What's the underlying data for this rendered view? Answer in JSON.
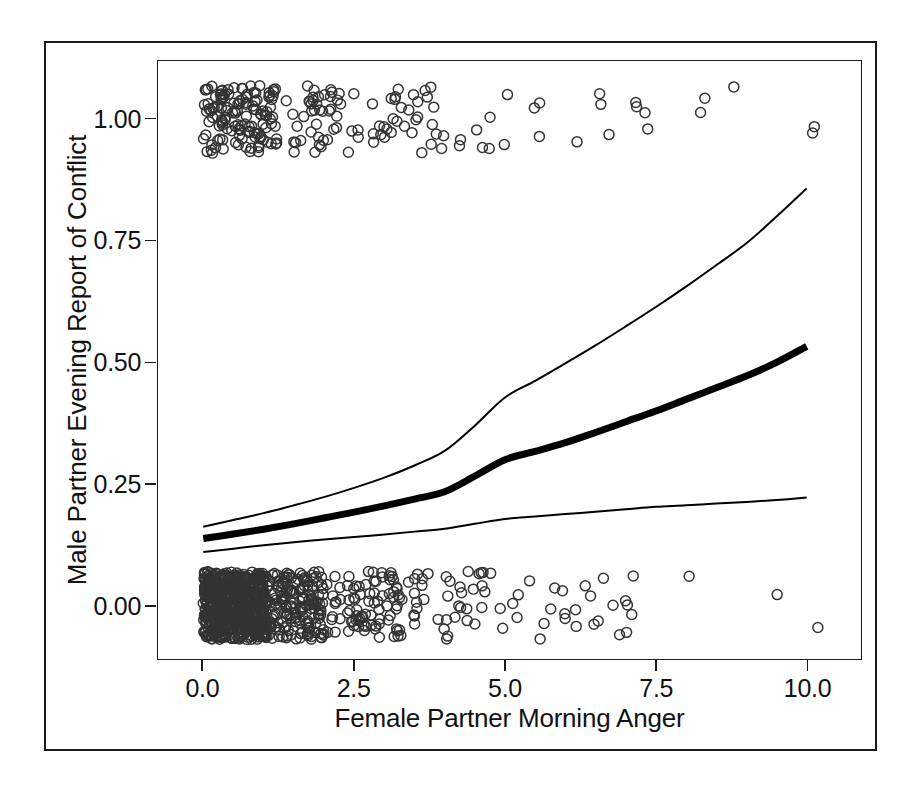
{
  "figure": {
    "background": "#ffffff",
    "frame_color": "#1a1a1a",
    "point_color": "#333333",
    "line_color": "#000000"
  },
  "chart_data": {
    "type": "scatter",
    "title": "",
    "xlabel": "Female Partner Morning Anger",
    "ylabel": "Male Partner Evening Report of Conflict",
    "xlim": [
      -0.75,
      10.9
    ],
    "ylim": [
      -0.11,
      1.12
    ],
    "xticks": [
      0.0,
      2.5,
      5.0,
      7.5,
      10.0
    ],
    "xtick_labels": [
      "0.0",
      "2.5",
      "5.0",
      "7.5",
      "10.0"
    ],
    "yticks": [
      0.0,
      0.25,
      0.5,
      0.75,
      1.0
    ],
    "ytick_labels": [
      "0.00",
      "0.25",
      "0.50",
      "0.75",
      "1.00"
    ],
    "grid": false,
    "legend": "none",
    "marker": "open-circle",
    "marker_size_px": 10,
    "series": [
      {
        "name": "fitted-probability",
        "type": "line",
        "style": "thick",
        "width_px": 7,
        "x": [
          0.0,
          0.5,
          1.0,
          1.5,
          2.0,
          2.5,
          3.0,
          3.5,
          4.0,
          4.5,
          5.0,
          5.5,
          6.0,
          6.5,
          7.0,
          7.5,
          8.0,
          8.5,
          9.0,
          9.5,
          10.0
        ],
        "values": [
          0.138,
          0.147,
          0.157,
          0.168,
          0.18,
          0.192,
          0.205,
          0.219,
          0.234,
          0.266,
          0.3,
          0.317,
          0.335,
          0.356,
          0.378,
          0.4,
          0.424,
          0.448,
          0.472,
          0.5,
          0.533
        ]
      },
      {
        "name": "confidence-upper",
        "type": "line",
        "style": "thin",
        "width_px": 2,
        "x": [
          0.0,
          0.5,
          1.0,
          1.5,
          2.0,
          2.5,
          3.0,
          3.5,
          4.0,
          4.5,
          5.0,
          5.5,
          6.0,
          6.5,
          7.0,
          7.5,
          8.0,
          8.5,
          9.0,
          9.5,
          10.0
        ],
        "values": [
          0.162,
          0.176,
          0.19,
          0.206,
          0.223,
          0.242,
          0.263,
          0.288,
          0.318,
          0.37,
          0.428,
          0.462,
          0.498,
          0.535,
          0.574,
          0.614,
          0.656,
          0.7,
          0.745,
          0.8,
          0.858
        ]
      },
      {
        "name": "confidence-lower",
        "type": "line",
        "style": "thin",
        "width_px": 2,
        "x": [
          0.0,
          0.5,
          1.0,
          1.5,
          2.0,
          2.5,
          3.0,
          3.5,
          4.0,
          4.5,
          5.0,
          5.5,
          6.0,
          6.5,
          7.0,
          7.5,
          8.0,
          8.5,
          9.0,
          9.5,
          10.0
        ],
        "values": [
          0.11,
          0.117,
          0.124,
          0.13,
          0.136,
          0.141,
          0.146,
          0.152,
          0.158,
          0.168,
          0.178,
          0.183,
          0.188,
          0.193,
          0.198,
          0.203,
          0.206,
          0.21,
          0.213,
          0.217,
          0.222
        ]
      }
    ],
    "scatter_bands": [
      {
        "name": "outcome-one-band",
        "y_center": 1.0,
        "y_jitter": 0.07,
        "n_points": 232,
        "x_distribution": "right-skewed, dense 0-1.5, sparse beyond 3"
      },
      {
        "name": "outcome-zero-band",
        "y_center": 0.0,
        "y_jitter": 0.07,
        "n_points": 900,
        "x_distribution": "right-skewed, saturated 0-1, thinning beyond 3"
      }
    ]
  }
}
